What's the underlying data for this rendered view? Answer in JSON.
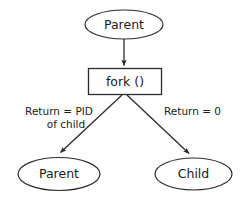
{
  "diagram": {
    "background_color": "#ffffff",
    "stroke_color": "#2b2b2b",
    "text_color": "#1a1a1a",
    "nodes": [
      {
        "id": "parent_top",
        "label": "Parent",
        "shape": "ellipse"
      },
      {
        "id": "fork_call",
        "label": "fork ()",
        "shape": "rectangle"
      },
      {
        "id": "parent_bottom",
        "label": "Parent",
        "shape": "ellipse"
      },
      {
        "id": "child_bottom",
        "label": "Child",
        "shape": "ellipse"
      }
    ],
    "edges": [
      {
        "id": "parent_to_fork",
        "from": "parent_top",
        "to": "parent_bottom",
        "label": ""
      },
      {
        "id": "fork_to_parent",
        "from": "fork_call",
        "to": "parent_bottom",
        "label_line1": "Return = PID",
        "label_line2": "of child"
      },
      {
        "id": "fork_to_child",
        "from": "fork_call",
        "to": "child_bottom",
        "label_line1": "Return = 0",
        "label_line2": ""
      }
    ]
  }
}
